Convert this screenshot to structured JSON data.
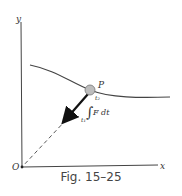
{
  "figure": {
    "caption": "Fig. 15–25",
    "axis_labels": {
      "x": "x",
      "y": "y",
      "origin": "O"
    },
    "point_label": "P",
    "integral": {
      "upper": "t₂",
      "lower": "t₁",
      "body": "F dt",
      "sign": "∫"
    },
    "colors": {
      "line": "#333333",
      "particle": "#bdbdbd",
      "arrow": "#111111"
    }
  }
}
